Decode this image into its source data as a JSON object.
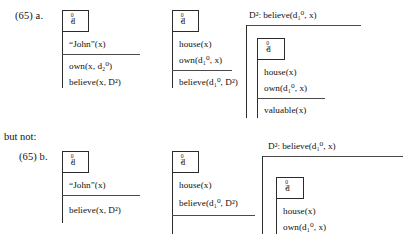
{
  "meta": {
    "but_not_label": "but not:"
  },
  "examples": [
    {
      "id": "65a",
      "number_label": "(65) a.",
      "columns": [
        {
          "id": "a-col1",
          "head": "d₁⁰",
          "head_base": "d",
          "head_sup": "0",
          "head_sub": "1",
          "conditions_top": [
            "“John”(x)"
          ],
          "conditions_bottom": [
            "own(x, d₂⁰)",
            "believe(x, D²)"
          ]
        },
        {
          "id": "a-col2",
          "head": "d₂⁰",
          "head_base": "d",
          "head_sup": "0",
          "head_sub": "2",
          "conditions_top": [
            "house(x)",
            "own(d₁⁰, x)"
          ],
          "conditions_bottom": [
            "believe(d₁⁰, D²)"
          ]
        },
        {
          "id": "a-col3",
          "outer_label": "D²: believe(d₁⁰, x)",
          "head": "d₂⁰",
          "head_base": "d",
          "head_sup": "0",
          "head_sub": "2",
          "conditions_top": [
            "house(x)",
            "own(d₁⁰, x)"
          ],
          "conditions_bottom": [
            "valuable(x)"
          ]
        }
      ]
    },
    {
      "id": "65b",
      "number_label": "(65) b.",
      "columns": [
        {
          "id": "b-col1",
          "head": "d₁⁰",
          "head_base": "d",
          "head_sup": "0",
          "head_sub": "1",
          "conditions_top": [
            "“John”(x)"
          ],
          "conditions_bottom": [
            "believe(x, D²)"
          ]
        },
        {
          "id": "b-col2",
          "head": "d₂⁰",
          "head_base": "d",
          "head_sup": "0",
          "head_sub": "2",
          "conditions_top": [
            "house(x)",
            "believe(d₁⁰, D²)"
          ],
          "conditions_bottom": []
        },
        {
          "id": "b-col3",
          "outer_label": "D²: believe(d₁⁰, x)",
          "head": "d₂⁰",
          "head_base": "d",
          "head_sup": "0",
          "head_sub": "2",
          "conditions_top": [
            "house(x)",
            "own(d₁⁰, x)"
          ],
          "conditions_bottom": []
        }
      ]
    }
  ],
  "colors": {
    "ink": "#1a1a1a",
    "rule": "#4a4a4a",
    "background": "#ffffff"
  }
}
